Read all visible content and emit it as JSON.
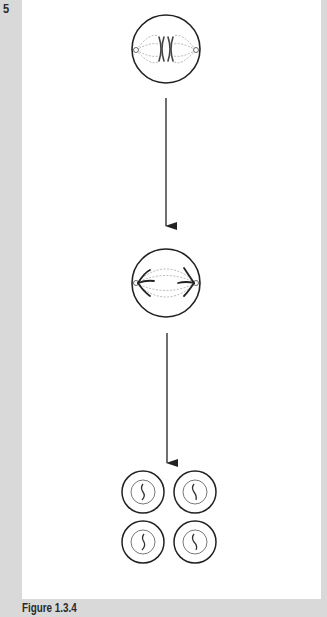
{
  "question": {
    "number": "5"
  },
  "figure": {
    "caption": "Figure 1.3.4",
    "stages": [
      {
        "id": "metaphase-cell",
        "description": "Cell with paired chromosomes (XX) at equator and spindle fibres to two poles"
      },
      {
        "id": "anaphase-cell",
        "description": "Cell with chromatids pulled toward opposite poles along spindle fibres"
      },
      {
        "id": "daughter-cells",
        "description": "Four daughter cells each with a single chromosome"
      }
    ],
    "arrows": [
      {
        "from": "metaphase-cell",
        "to": "anaphase-cell"
      },
      {
        "from": "anaphase-cell",
        "to": "daughter-cells"
      }
    ]
  },
  "colors": {
    "background": "#d9d9d9",
    "panel": "#ffffff",
    "stroke": "#222222",
    "spindle": "#9a9a9a"
  }
}
